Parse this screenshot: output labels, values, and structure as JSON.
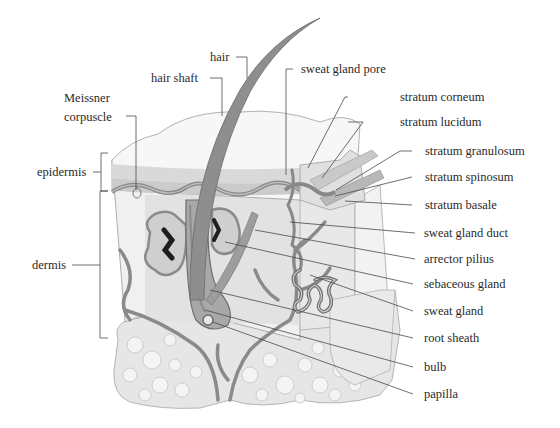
{
  "diagram": {
    "colors": {
      "background": "#ffffff",
      "line": "#555555",
      "skin_light": "#ececec",
      "skin_mid": "#d6d6d6",
      "skin_dark": "#a8a8a8",
      "vessel": "#8c8c8c",
      "fat": "#e4e4e4",
      "text": "#2a2a2a"
    },
    "left_labels": {
      "meissner_1": "Meissner",
      "meissner_2": "corpuscle",
      "epidermis": "epidermis",
      "dermis": "dermis"
    },
    "top_labels": {
      "hair": "hair",
      "hair_shaft": "hair shaft",
      "sweat_gland_pore": "sweat gland pore"
    },
    "right_labels": [
      {
        "id": "stratum-corneum",
        "text": "stratum corneum"
      },
      {
        "id": "stratum-lucidum",
        "text": "stratum lucidum"
      },
      {
        "id": "stratum-granulosum",
        "text": "stratum granulosum"
      },
      {
        "id": "stratum-spinosum",
        "text": "stratum spinosum"
      },
      {
        "id": "stratum-basale",
        "text": "stratum basale"
      },
      {
        "id": "sweat-gland-duct",
        "text": "sweat gland duct"
      },
      {
        "id": "arrector-pilius",
        "text": "arrector pilius"
      },
      {
        "id": "sebaceous-gland",
        "text": "sebaceous gland"
      },
      {
        "id": "sweat-gland",
        "text": "sweat gland"
      },
      {
        "id": "root-sheath",
        "text": "root sheath"
      },
      {
        "id": "bulb",
        "text": "bulb"
      },
      {
        "id": "papilla",
        "text": "papilla"
      }
    ]
  }
}
